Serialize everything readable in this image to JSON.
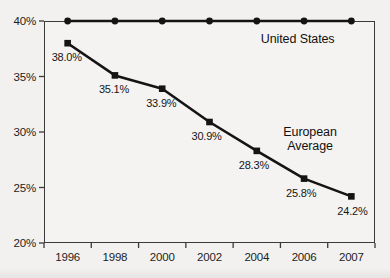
{
  "chart_data": {
    "type": "line",
    "title": "",
    "xlabel": "",
    "ylabel": "",
    "categories": [
      "1996",
      "1998",
      "2000",
      "2002",
      "2004",
      "2006",
      "2007"
    ],
    "ylim": [
      20,
      40
    ],
    "yticks": [
      "20%",
      "25%",
      "30%",
      "35%",
      "40%"
    ],
    "ytick_values": [
      20,
      25,
      30,
      35,
      40
    ],
    "grid": false,
    "legend_position": "inline-annotation",
    "series": [
      {
        "name": "United States",
        "marker": "circle",
        "values": [
          40.0,
          40.0,
          40.0,
          40.0,
          40.0,
          40.0,
          40.0
        ],
        "point_labels": [
          "",
          "",
          "",
          "",
          "",
          "",
          ""
        ]
      },
      {
        "name": "European Average",
        "marker": "square",
        "values": [
          38.0,
          35.1,
          33.9,
          30.9,
          28.3,
          25.8,
          24.2
        ],
        "point_labels": [
          "38.0%",
          "35.1%",
          "33.9%",
          "30.9%",
          "28.3%",
          "25.8%",
          "24.2%"
        ]
      }
    ],
    "annotations": [
      {
        "text": "United States",
        "lines": [
          "United States"
        ]
      },
      {
        "text": "European Average",
        "lines": [
          "European",
          "Average"
        ]
      }
    ]
  },
  "colors": {
    "line": "#141414",
    "axis": "#3a3a3a",
    "text": "#161616",
    "background": "#f2f1ef"
  }
}
